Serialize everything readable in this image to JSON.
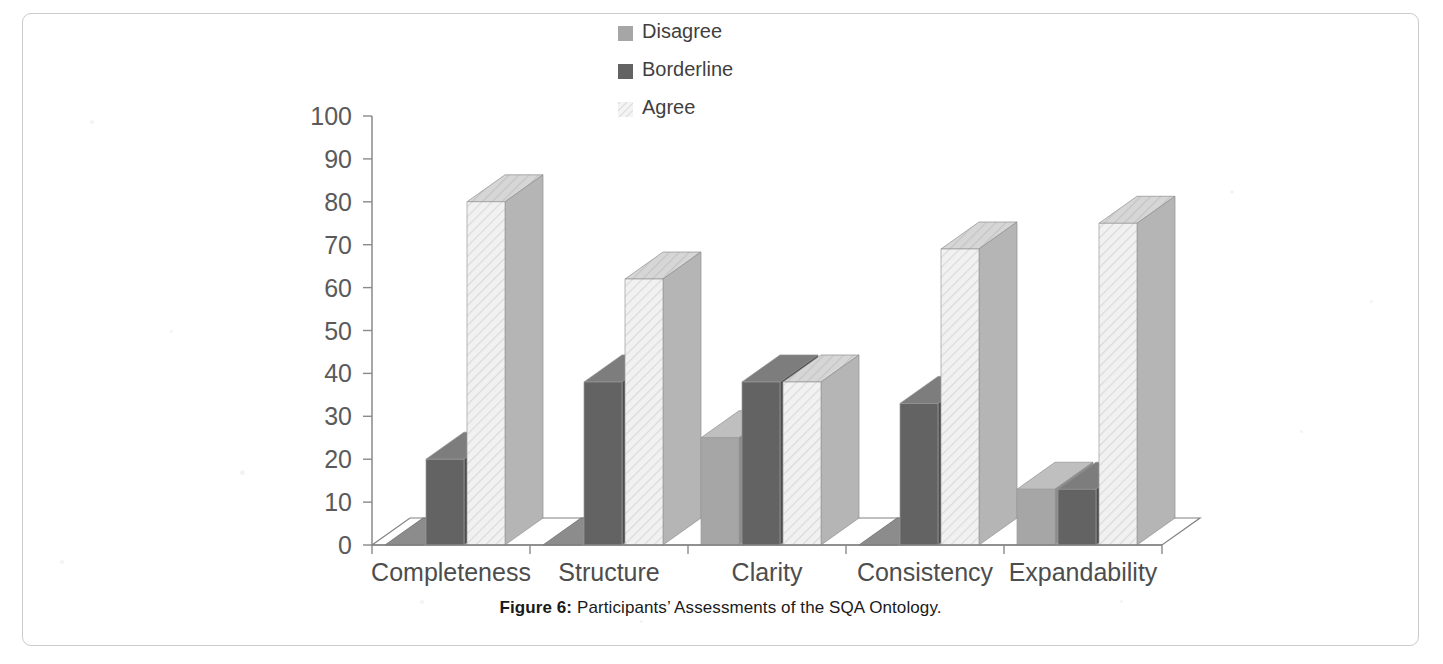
{
  "figure": {
    "caption_label": "Figure 6:",
    "caption_text": " Participants’ Assessments of the SQA Ontology."
  },
  "chart_data": {
    "type": "bar",
    "title": "",
    "subtitle": "",
    "xlabel": "",
    "ylabel": "",
    "ylim": [
      0,
      100
    ],
    "ytick_step": 10,
    "yticks": [
      "100",
      "90",
      "80",
      "70",
      "60",
      "50",
      "40",
      "30",
      "20",
      "10",
      "0"
    ],
    "grid": false,
    "legend_position": "top-center",
    "three_d": true,
    "categories": [
      "Completeness",
      "Structure",
      "Clarity",
      "Consistency",
      "Expandability"
    ],
    "series": [
      {
        "name": "Disagree",
        "color": "#a6a6a6",
        "side_color": "#8c8c8c",
        "top_color": "#bfbfbf",
        "pattern": "solid",
        "values": [
          0,
          0,
          25,
          0,
          13
        ]
      },
      {
        "name": "Borderline",
        "color": "#636363",
        "side_color": "#4d4d4d",
        "top_color": "#7d7d7d",
        "pattern": "solid",
        "values": [
          20,
          38,
          38,
          33,
          13
        ]
      },
      {
        "name": "Agree",
        "color": "#ededed",
        "side_color": "#b5b5b5",
        "top_color": "#cfcfcf",
        "pattern": "diagonal-hatch",
        "values": [
          80,
          62,
          38,
          69,
          75
        ]
      }
    ]
  },
  "axis": {
    "baseline_color": "#808080",
    "axis_color": "#808080",
    "tick_color": "#8a8a8a"
  }
}
